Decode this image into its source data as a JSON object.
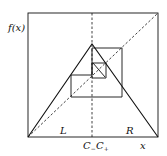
{
  "diagram": {
    "type": "cobweb-plot",
    "labels": {
      "y_axis": "f(x)",
      "x_axis": "x",
      "left_region": "L",
      "right_region": "R",
      "c_minus": "C",
      "c_minus_sub": "−",
      "c_plus": "C",
      "c_plus_sub": "+"
    },
    "colors": {
      "stroke": "#111111",
      "background": "#ffffff"
    }
  }
}
